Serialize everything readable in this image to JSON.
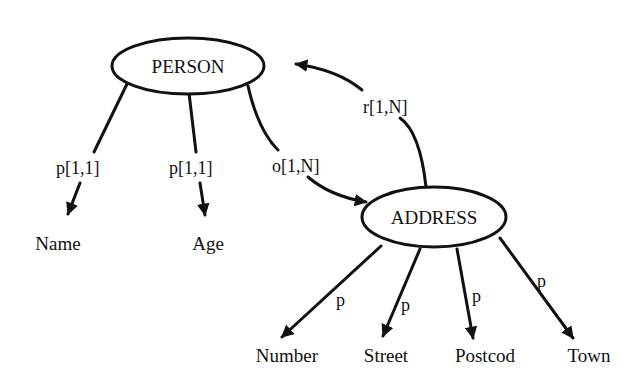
{
  "diagram": {
    "type": "object-relationship-graph",
    "nodes": {
      "person": {
        "label": "PERSON"
      },
      "address": {
        "label": "ADDRESS"
      }
    },
    "leaves": {
      "name": {
        "label": "Name"
      },
      "age": {
        "label": "Age"
      },
      "number": {
        "label": "Number"
      },
      "street": {
        "label": "Street"
      },
      "postcode": {
        "label": "Postcod"
      },
      "town": {
        "label": "Town"
      }
    },
    "edges": {
      "person_name": {
        "from": "PERSON",
        "to": "Name",
        "label": "p[1,1]"
      },
      "person_age": {
        "from": "PERSON",
        "to": "Age",
        "label": "p[1,1]"
      },
      "person_address": {
        "from": "PERSON",
        "to": "ADDRESS",
        "label": "o[1,N]"
      },
      "address_person": {
        "from": "ADDRESS",
        "to": "PERSON",
        "label": "r[1,N]"
      },
      "address_number": {
        "from": "ADDRESS",
        "to": "Number",
        "label": "p"
      },
      "address_street": {
        "from": "ADDRESS",
        "to": "Street",
        "label": "p"
      },
      "address_postcode": {
        "from": "ADDRESS",
        "to": "Postcod",
        "label": "p"
      },
      "address_town": {
        "from": "ADDRESS",
        "to": "Town",
        "label": "p"
      }
    },
    "colors": {
      "ink": "#111111",
      "background": "#ffffff"
    }
  }
}
